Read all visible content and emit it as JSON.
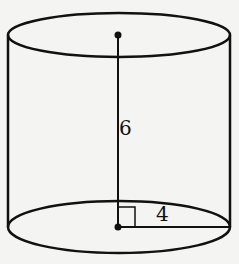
{
  "diagram": {
    "shape": "cylinder",
    "height_label": "6",
    "radius_label": "4",
    "stroke_color": "#111111",
    "background_color": "#f4f4f2",
    "right_angle_marker": true
  }
}
